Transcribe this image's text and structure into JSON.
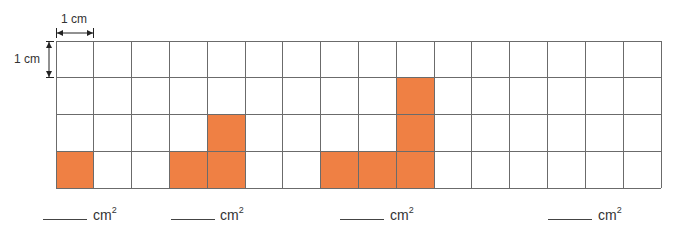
{
  "scale": {
    "horizontal_label": "1 cm",
    "vertical_label": "1 cm"
  },
  "grid": {
    "columns": 16,
    "rows": 4,
    "fill_color": "#EF8044",
    "line_color": "#6b6b6b",
    "shapes": [
      {
        "name": "shape-1",
        "cells": [
          [
            0,
            3
          ]
        ]
      },
      {
        "name": "shape-2",
        "cells": [
          [
            3,
            3
          ],
          [
            4,
            3
          ],
          [
            4,
            2
          ]
        ]
      },
      {
        "name": "shape-3",
        "cells": [
          [
            7,
            3
          ],
          [
            8,
            3
          ],
          [
            9,
            3
          ],
          [
            9,
            2
          ],
          [
            9,
            1
          ]
        ]
      },
      {
        "name": "shape-4",
        "cells": []
      }
    ]
  },
  "answers": [
    {
      "blank": "",
      "unit": "cm",
      "exponent": "2"
    },
    {
      "blank": "",
      "unit": "cm",
      "exponent": "2"
    },
    {
      "blank": "",
      "unit": "cm",
      "exponent": "2"
    },
    {
      "blank": "",
      "unit": "cm",
      "exponent": "2"
    }
  ]
}
